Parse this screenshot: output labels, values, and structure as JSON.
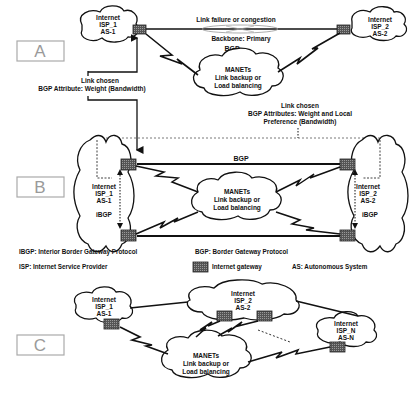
{
  "panels": {
    "A": {
      "label": "A",
      "isp1": {
        "line1": "Internet",
        "line2": "ISP_1",
        "line3": "AS-1"
      },
      "isp2": {
        "line1": "Internet",
        "line2": "ISP_2",
        "line3": "AS-2"
      },
      "link_failure": "Link failure or congestion",
      "backbone": "Backbone: Primary",
      "bgp": "BGP",
      "manet": {
        "line1": "MANETs",
        "line2": "Link backup or",
        "line3": "Load balancing"
      },
      "chosen_left": {
        "line1": "Link chosen",
        "line2": "BGP Attribute: Weight (Bandwidth)"
      },
      "chosen_right": {
        "line1": "Link chosen",
        "line2": "BGP Attributes: Weight and Local",
        "line3": "Preference (Bandwidth)"
      }
    },
    "B": {
      "label": "B",
      "isp1": {
        "line1": "Internet",
        "line2": "ISP_1",
        "line3": "AS-1",
        "ibgp": "iBGP"
      },
      "isp2": {
        "line1": "Internet",
        "line2": "ISP_2",
        "line3": "AS-2",
        "ibgp": "iBGP"
      },
      "bgp": "BGP",
      "manet": {
        "line1": "MANETs",
        "line2": "Link backup or",
        "line3": "Load balancing"
      }
    },
    "C": {
      "label": "C",
      "isp1": {
        "line1": "Internet",
        "line2": "ISP_1",
        "line3": "AS-1"
      },
      "isp2": {
        "line1": "Internet",
        "line2": "ISP_2",
        "line3": "AS-2"
      },
      "ispn": {
        "line1": "Internet",
        "line2": "ISP_N",
        "line3": "AS-N"
      },
      "manet": {
        "line1": "MANETs",
        "line2": "Link backup or",
        "line3": "Load balancing"
      }
    }
  },
  "legend": {
    "ibgp": "IBGP: Interior Border Gateway Protocol",
    "bgp": "BGP: Border Gateway Protocol",
    "isp": "ISP:   Internet Service Provider",
    "gateway": "Internet gateway",
    "as": "AS: Autonomous System"
  },
  "colors": {
    "line": "#111111",
    "gateway": "#6a6a6a",
    "label_box": "#9a9a9a"
  }
}
